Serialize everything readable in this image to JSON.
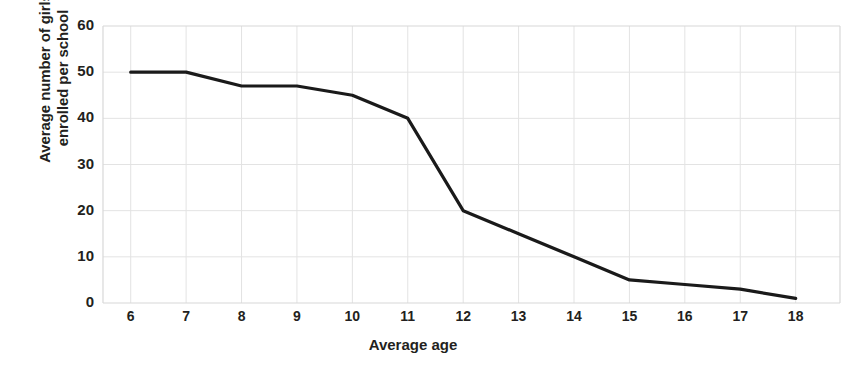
{
  "chart_data": {
    "type": "line",
    "title": "",
    "xlabel": "Average age",
    "ylabel": "Average number of girls\nenrolled per school",
    "ylabel_line1": "Average number of girls",
    "ylabel_line2": "enrolled per school",
    "x": [
      6,
      7,
      8,
      9,
      10,
      11,
      12,
      13,
      14,
      15,
      16,
      17,
      18
    ],
    "values": [
      50,
      50,
      47,
      47,
      45,
      40,
      20,
      15,
      10,
      5,
      4,
      3,
      1
    ],
    "series": [
      {
        "name": "Average number of girls enrolled per school",
        "values": [
          50,
          50,
          47,
          47,
          45,
          40,
          20,
          15,
          10,
          5,
          4,
          3,
          1
        ]
      }
    ],
    "xticks": [
      "6",
      "7",
      "8",
      "9",
      "10",
      "11",
      "12",
      "13",
      "14",
      "15",
      "16",
      "17",
      "18"
    ],
    "yticks": [
      "0",
      "10",
      "20",
      "30",
      "40",
      "50",
      "60"
    ],
    "xlim": [
      5.5,
      18.8
    ],
    "ylim": [
      0,
      60
    ],
    "grid": true,
    "legend": "none",
    "line_color": "#1a1a1a",
    "grid_color": "#e3e3e3",
    "axis_color": "#d8d8d8",
    "background_color": "#ffffff",
    "text_color": "#231f20"
  }
}
